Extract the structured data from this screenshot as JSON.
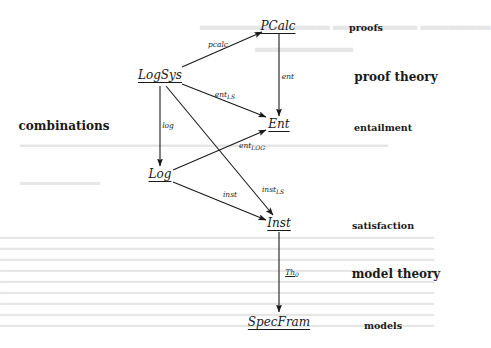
{
  "diagram": {
    "nodes": {
      "pcalc": "PCalc",
      "logsys": "LogSys",
      "ent": "Ent",
      "log": "Log",
      "inst": "Inst",
      "specfram": "SpecFram"
    },
    "arrows": {
      "pcalc": "pcalc",
      "ent": "ent",
      "ent_ls": {
        "base": "ent",
        "sub": "LS"
      },
      "log": "log",
      "ent_log": {
        "base": "ent",
        "sub": "LOG"
      },
      "inst": "inst",
      "inst_ls": {
        "base": "inst",
        "sub": "LS"
      },
      "th0": {
        "base": "Th",
        "sub": "0"
      }
    },
    "side_labels": {
      "proofs": "proofs",
      "proof_theory": "proof theory",
      "combinations": "combinations",
      "entailment": "entailment",
      "satisfaction": "satisfaction",
      "model_theory": "model theory",
      "models": "models"
    },
    "colors": {
      "ink": "#1a1a1a",
      "paper": "#ffffff",
      "bleed_through": "#e6e6e6"
    }
  }
}
